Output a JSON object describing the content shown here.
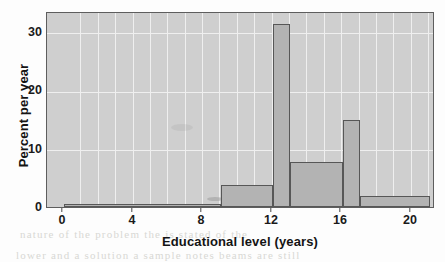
{
  "chart_data": {
    "type": "bar",
    "title": "",
    "subtitle": "",
    "xlabel": "Educational level (years)",
    "ylabel": "Percent per year",
    "xlim": [
      -1,
      21.2
    ],
    "ylim": [
      0,
      35.5
    ],
    "xticks": [
      0,
      4,
      8,
      12,
      16,
      20
    ],
    "xticklabels": [
      "0",
      "4",
      "8",
      "12",
      "16",
      "20"
    ],
    "yticks": [
      0,
      10,
      20,
      30
    ],
    "yticklabels": [
      "0",
      "10",
      "20",
      "30"
    ],
    "grid": true,
    "legend": "none",
    "bin_edges": [
      0,
      9,
      12,
      13,
      16,
      17,
      21
    ],
    "categories": [
      "0-9",
      "9-12",
      "12-13",
      "13-16",
      "16-17",
      "17-21"
    ],
    "values": [
      0.6,
      4.0,
      33.5,
      8.2,
      16.0,
      2.0
    ],
    "bars": [
      {
        "start": 0,
        "end": 9,
        "height": 0.6
      },
      {
        "start": 9,
        "end": 12,
        "height": 4.0
      },
      {
        "start": 12,
        "end": 13,
        "height": 33.5
      },
      {
        "start": 13,
        "end": 16,
        "height": 8.2
      },
      {
        "start": 16,
        "end": 17,
        "height": 16.0
      },
      {
        "start": 17,
        "end": 21,
        "height": 2.0
      }
    ],
    "bar_fill_color": "#b3b3b3",
    "bar_edge_color": "#575757",
    "plot_background_color": "#cfcfcf",
    "gridline_color": "#efefef"
  },
  "page": {
    "bleed_lines": [
      "of   a   crossing   file  of   it   sage   rally   angle   of   the",
      "nature   of   the   problem   the   is   stated   of   the",
      "lower   and   a   solution   a   sample   notes   beams   are   still"
    ]
  }
}
